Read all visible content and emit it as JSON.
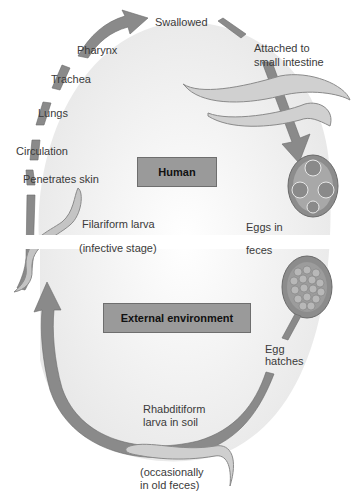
{
  "diagram": {
    "regions": {
      "human": "Human",
      "external": "External environment"
    },
    "labels": {
      "swallowed": "Swallowed",
      "pharynx": "Pharynx",
      "trachea": "Trachea",
      "lungs": "Lungs",
      "circulation": "Circulation",
      "penetrates_skin": "Penetrates skin",
      "attached_1": "Attached to",
      "attached_2": "small intestine",
      "filariform": "Filariform larva",
      "infective": "(infective stage)",
      "eggs_in": "Eggs in",
      "feces": "feces",
      "egg": "Egg",
      "hatches": "hatches",
      "rhabditiform_1": "Rhabditiform",
      "rhabditiform_2": "larva in soil",
      "occasionally_1": "(occasionally",
      "occasionally_2": "in old feces)"
    },
    "colors": {
      "arrow": "#8a8a8a",
      "arrow_edge": "#6a6a6a",
      "box": "#9a9a9a",
      "background_gradient": "#e9e9e9",
      "egg_shell": "#8c8c8c",
      "egg_inner": "#b5b5b5",
      "worm": "#c9c9c9"
    }
  }
}
